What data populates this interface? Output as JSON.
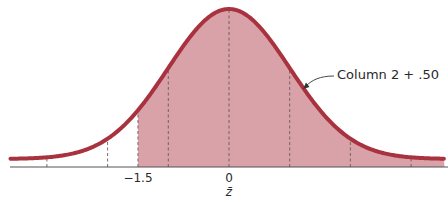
{
  "chart_data": {
    "type": "area",
    "title": "",
    "subtitle": "",
    "xlabel": "z̄",
    "ylabel": "",
    "distribution": {
      "name": "normal",
      "mean": 0,
      "sd": 1
    },
    "x_range": [
      -3.6,
      3.55
    ],
    "shaded_region": {
      "from": -1.5,
      "to": 3.55
    },
    "reference_lines_z": [
      -3,
      -2,
      -1.5,
      -1,
      0,
      1,
      2,
      3
    ],
    "grid": false,
    "legend": null,
    "tick_labels": [
      {
        "value": -1.5,
        "label": "−1.5"
      },
      {
        "value": 0,
        "label": "0"
      }
    ],
    "annotations": [
      {
        "text": "Column 2 + .50",
        "points_to_z": 1.25
      }
    ]
  },
  "colors": {
    "curve": "#a8323e",
    "fill": "#d9a1a8",
    "axis": "#555555",
    "dash": "#6b5a5c",
    "text": "#2a2a2a"
  },
  "labels": {
    "tick_neg_1_5": "−1.5",
    "tick_0": "0",
    "axis_label": "z̄",
    "annotation": "Column 2 + .50"
  }
}
